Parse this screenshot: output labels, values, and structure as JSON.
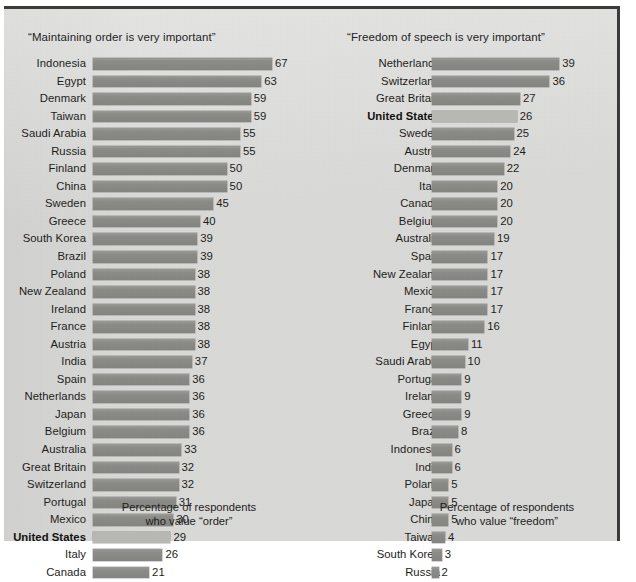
{
  "chart_data": [
    {
      "type": "bar",
      "id": "order",
      "title": "“Maintaining order is very important”",
      "xlabel": "Percentage of respondents\nwho value “order”",
      "ylabel": "",
      "orientation": "horizontal",
      "grid": false,
      "legend": "none",
      "xlim": [
        0,
        67
      ],
      "highlight": "United States",
      "categories": [
        "Indonesia",
        "Egypt",
        "Denmark",
        "Taiwan",
        "Saudi Arabia",
        "Russia",
        "Finland",
        "China",
        "Sweden",
        "Greece",
        "South Korea",
        "Brazil",
        "Poland",
        "New Zealand",
        "Ireland",
        "France",
        "Austria",
        "India",
        "Spain",
        "Netherlands",
        "Japan",
        "Belgium",
        "Australia",
        "Great Britain",
        "Switzerland",
        "Portugal",
        "Mexico",
        "United States",
        "Italy",
        "Canada"
      ],
      "values": [
        67,
        63,
        59,
        59,
        55,
        55,
        50,
        50,
        45,
        40,
        39,
        39,
        38,
        38,
        38,
        38,
        38,
        37,
        36,
        36,
        36,
        36,
        33,
        32,
        32,
        31,
        30,
        29,
        26,
        21
      ]
    },
    {
      "type": "bar",
      "id": "freedom",
      "title": "“Freedom of speech is very important”",
      "xlabel": "Percentage of respondents\nwho value “freedom”",
      "ylabel": "",
      "orientation": "horizontal",
      "grid": false,
      "legend": "none",
      "xlim": [
        0,
        39
      ],
      "highlight": "United States",
      "categories": [
        "Netherlands",
        "Switzerland",
        "Great Britain",
        "United States",
        "Sweden",
        "Austria",
        "Denmark",
        "Italy",
        "Canada",
        "Belgium",
        "Australia",
        "Spain",
        "New Zealand",
        "Mexico",
        "France",
        "Finland",
        "Egypt",
        "Saudi Arabia",
        "Portugal",
        "Ireland",
        "Greece",
        "Brazil",
        "Indonesia",
        "India",
        "Poland",
        "Japan",
        "China",
        "Taiwan",
        "South Korea",
        "Russia"
      ],
      "values": [
        39,
        36,
        27,
        26,
        25,
        24,
        22,
        20,
        20,
        20,
        19,
        17,
        17,
        17,
        17,
        16,
        11,
        10,
        9,
        9,
        9,
        8,
        6,
        6,
        5,
        5,
        5,
        4,
        3,
        2
      ]
    }
  ],
  "colors": {
    "bar": "#8b8b88",
    "bar_highlight": "#b8b8b4",
    "paper": "#d9d9d7",
    "border": "#3b3b3b",
    "text": "#1d1d1a"
  },
  "source_note": ""
}
